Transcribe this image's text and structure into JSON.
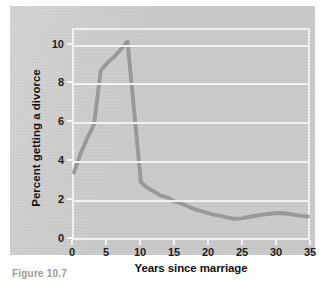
{
  "figure": {
    "caption": "Figure 10.7"
  },
  "chart_data": {
    "type": "line",
    "title": "",
    "subtitle": "",
    "xlabel": "Years since marriage",
    "ylabel": "Percent getting a divorce",
    "xlim": [
      0,
      35
    ],
    "ylim": [
      0,
      10.8
    ],
    "xticks": [
      "0",
      "5",
      "10",
      "15",
      "20",
      "25",
      "30",
      "35"
    ],
    "xtick_values": [
      0,
      5,
      10,
      15,
      20,
      25,
      30,
      35
    ],
    "yticks": [
      "0",
      "2",
      "4",
      "6",
      "8",
      "10"
    ],
    "ytick_values": [
      0,
      2,
      4,
      6,
      8,
      10
    ],
    "grid": "horizontal",
    "legend": "none",
    "line_color": "#9a9a9a",
    "line_width": 4,
    "series": [
      {
        "name": "Percent getting a divorce",
        "x": [
          0,
          1,
          2,
          3,
          4,
          5,
          6,
          7,
          8,
          9,
          10,
          11,
          12,
          13,
          14,
          15,
          16,
          17,
          18,
          19,
          20,
          21,
          22,
          23,
          24,
          25,
          26,
          27,
          28,
          29,
          30,
          31,
          32,
          33,
          34,
          35
        ],
        "values": [
          3.4,
          4.4,
          5.2,
          5.9,
          8.7,
          9.1,
          9.4,
          9.8,
          10.2,
          6.6,
          2.9,
          2.6,
          2.4,
          2.2,
          2.1,
          1.9,
          1.8,
          1.65,
          1.5,
          1.4,
          1.3,
          1.2,
          1.15,
          1.05,
          1.0,
          1.02,
          1.08,
          1.14,
          1.2,
          1.25,
          1.28,
          1.3,
          1.26,
          1.2,
          1.15,
          1.12
        ]
      }
    ],
    "annotations": []
  },
  "colors": {
    "panel_background": "#cfcfcf",
    "plot_background": "#cecece",
    "gridline": "#f6f6f6",
    "axis": "#f8f8f8",
    "text": "#111111",
    "line": "#9a9a9a",
    "caption": "#9a9a9a"
  }
}
